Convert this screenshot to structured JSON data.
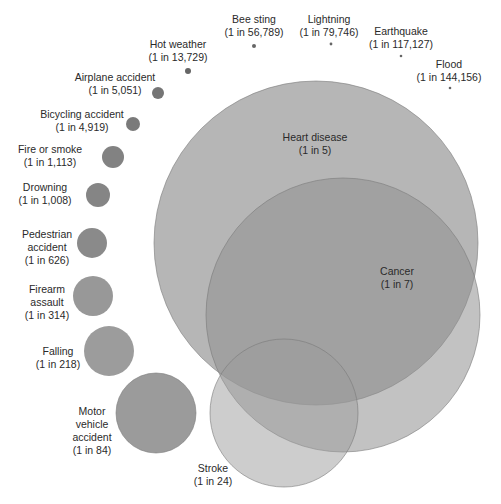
{
  "chart_data": {
    "type": "bubble",
    "title": "",
    "unit_note": "Lifetime odds of dying",
    "colors": {
      "dot": "#6e6e6e",
      "small": "#7d7d7d",
      "large": "#9a9a9a",
      "stroke": "#8a8a8a"
    },
    "items": [
      {
        "name": "Heart disease",
        "odds": "(1 in 5)",
        "odds_value": 5,
        "cx": 316,
        "cy": 243,
        "r": 162,
        "fill": "#a9a9a9",
        "opacity": 0.85,
        "label_x": 315,
        "label_y": 131,
        "label_lines": [
          "Heart disease",
          "(1 in 5)"
        ]
      },
      {
        "name": "Cancer",
        "odds": "(1 in 7)",
        "odds_value": 7,
        "cx": 343,
        "cy": 315,
        "r": 137,
        "fill": "#8f8f8f",
        "opacity": 0.55,
        "label_x": 397,
        "label_y": 265,
        "label_lines": [
          "Cancer",
          "(1 in 7)"
        ]
      },
      {
        "name": "Stroke",
        "odds": "(1 in 24)",
        "odds_value": 24,
        "cx": 284,
        "cy": 413,
        "r": 74,
        "fill": "#9c9c9c",
        "opacity": 0.5,
        "label_x": 213,
        "label_y": 462,
        "label_lines": [
          "Stroke",
          "(1 in 24)"
        ]
      },
      {
        "name": "Motor vehicle accident",
        "odds": "(1 in 84)",
        "odds_value": 84,
        "cx": 156,
        "cy": 413,
        "r": 40,
        "fill": "#9b9b9b",
        "opacity": 1,
        "label_x": 92,
        "label_y": 405,
        "label_lines": [
          "Motor",
          "vehicle",
          "accident",
          "(1 in 84)"
        ]
      },
      {
        "name": "Falling",
        "odds": "(1 in 218)",
        "odds_value": 218,
        "cx": 109,
        "cy": 351,
        "r": 25,
        "fill": "#9c9c9c",
        "opacity": 1,
        "label_x": 58,
        "label_y": 345,
        "label_lines": [
          "Falling",
          "(1 in 218)"
        ]
      },
      {
        "name": "Firearm assault",
        "odds": "(1 in 314)",
        "odds_value": 314,
        "cx": 93,
        "cy": 296,
        "r": 20,
        "fill": "#989898",
        "opacity": 1,
        "label_x": 47,
        "label_y": 283,
        "label_lines": [
          "Firearm",
          "assault",
          "(1 in 314)"
        ]
      },
      {
        "name": "Pedestrian accident",
        "odds": "(1 in 626)",
        "odds_value": 626,
        "cx": 92,
        "cy": 243,
        "r": 15,
        "fill": "#8a8a8a",
        "opacity": 1,
        "label_x": 47,
        "label_y": 228,
        "label_lines": [
          "Pedestrian",
          "accident",
          "(1 in 626)"
        ]
      },
      {
        "name": "Drowning",
        "odds": "(1 in 1,008)",
        "odds_value": 1008,
        "cx": 98,
        "cy": 195,
        "r": 12,
        "fill": "#858585",
        "opacity": 1,
        "label_x": 45,
        "label_y": 181,
        "label_lines": [
          "Drowning",
          "(1 in 1,008)"
        ]
      },
      {
        "name": "Fire or smoke",
        "odds": "(1 in 1,113)",
        "odds_value": 1113,
        "cx": 113,
        "cy": 157,
        "r": 11,
        "fill": "#828282",
        "opacity": 1,
        "label_x": 50,
        "label_y": 143,
        "label_lines": [
          "Fire or smoke",
          "(1 in 1,113)"
        ]
      },
      {
        "name": "Bicycling accident",
        "odds": "(1 in 4,919)",
        "odds_value": 4919,
        "cx": 133,
        "cy": 124,
        "r": 7,
        "fill": "#7a7a7a",
        "opacity": 1,
        "label_x": 82,
        "label_y": 108,
        "label_lines": [
          "Bicycling accident",
          "(1 in 4,919)"
        ]
      },
      {
        "name": "Airplane accident",
        "odds": "(1 in 5,051)",
        "odds_value": 5051,
        "cx": 158,
        "cy": 93,
        "r": 6,
        "fill": "#757575",
        "opacity": 1,
        "label_x": 115,
        "label_y": 71,
        "label_lines": [
          "Airplane accident",
          "(1 in 5,051)"
        ]
      },
      {
        "name": "Hot weather",
        "odds": "(1 in 13,729)",
        "odds_value": 13729,
        "cx": 188,
        "cy": 71,
        "r": 3,
        "fill": "#666666",
        "opacity": 1,
        "label_x": 178,
        "label_y": 38,
        "label_lines": [
          "Hot weather",
          "(1 in 13,729)"
        ]
      },
      {
        "name": "Bee sting",
        "odds": "(1 in 56,789)",
        "odds_value": 56789,
        "cx": 254,
        "cy": 46,
        "r": 2,
        "fill": "#666666",
        "opacity": 1,
        "label_x": 254,
        "label_y": 13,
        "label_lines": [
          "Bee sting",
          "(1 in 56,789)"
        ]
      },
      {
        "name": "Lightning",
        "odds": "(1 in 79,746)",
        "odds_value": 79746,
        "cx": 331,
        "cy": 44,
        "r": 1.4,
        "fill": "#666666",
        "opacity": 1,
        "label_x": 329,
        "label_y": 13,
        "label_lines": [
          "Lightning",
          "(1 in 79,746)"
        ]
      },
      {
        "name": "Earthquake",
        "odds": "(1 in 117,127)",
        "odds_value": 117127,
        "cx": 401,
        "cy": 56,
        "r": 1.3,
        "fill": "#666666",
        "opacity": 1,
        "label_x": 401,
        "label_y": 25,
        "label_lines": [
          "Earthquake",
          "(1 in 117,127)"
        ]
      },
      {
        "name": "Flood",
        "odds": "(1 in 144,156)",
        "odds_value": 144156,
        "cx": 450,
        "cy": 88,
        "r": 1.3,
        "fill": "#666666",
        "opacity": 1,
        "label_x": 449,
        "label_y": 58,
        "label_lines": [
          "Flood",
          "(1 in 144,156)"
        ]
      }
    ]
  }
}
